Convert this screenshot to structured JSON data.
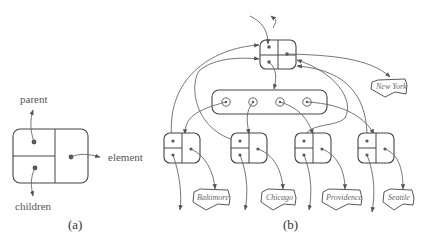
{
  "panel_a": {
    "caption": "(a)",
    "labels": {
      "parent": "parent",
      "children": "children",
      "element": "element"
    }
  },
  "panel_b": {
    "caption": "(b)",
    "root_element": "New York",
    "children_elements": [
      "Baltimore",
      "Chicago",
      "Providence",
      "Seattle"
    ]
  },
  "colors": {
    "stroke": "#444444",
    "edge": "#666666",
    "text": "#555555"
  }
}
